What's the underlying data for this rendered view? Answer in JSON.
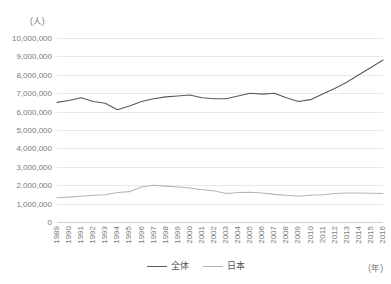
{
  "chart_data": {
    "type": "line",
    "title": "",
    "xlabel": "(年)",
    "ylabel": "(人)",
    "ylim": [
      0,
      10000000
    ],
    "ytick_step": 1000000,
    "grid": true,
    "legend_position": "bottom-center",
    "categories": [
      "1989",
      "1990",
      "1991",
      "1992",
      "1993",
      "1994",
      "1995",
      "1996",
      "1997",
      "1998",
      "1999",
      "2000",
      "2001",
      "2002",
      "2003",
      "2004",
      "2005",
      "2006",
      "2007",
      "2008",
      "2009",
      "2010",
      "2011",
      "2012",
      "2013",
      "2014",
      "2015",
      "2016"
    ],
    "yticks": [
      "0",
      "1,000,000",
      "2,000,000",
      "3,000,000",
      "4,000,000",
      "5,000,000",
      "6,000,000",
      "7,000,000",
      "8,000,000",
      "9,000,000",
      "10,000,000"
    ],
    "series": [
      {
        "name": "全体",
        "color": "#5a5a5a",
        "values": [
          6500000,
          6600000,
          6750000,
          6550000,
          6450000,
          6100000,
          6300000,
          6550000,
          6700000,
          6800000,
          6850000,
          6900000,
          6750000,
          6700000,
          6700000,
          6850000,
          7000000,
          6950000,
          7000000,
          6750000,
          6550000,
          6650000,
          6950000,
          7250000,
          7600000,
          8000000,
          8400000,
          8800000
        ]
      },
      {
        "name": "日本",
        "color": "#b4b4b4",
        "values": [
          1320000,
          1350000,
          1400000,
          1450000,
          1480000,
          1600000,
          1650000,
          1900000,
          2000000,
          1950000,
          1900000,
          1850000,
          1750000,
          1700000,
          1550000,
          1600000,
          1620000,
          1580000,
          1500000,
          1450000,
          1400000,
          1450000,
          1480000,
          1550000,
          1580000,
          1580000,
          1560000,
          1550000
        ]
      }
    ]
  },
  "legend": {
    "items": [
      {
        "label": "全体"
      },
      {
        "label": "日本"
      }
    ]
  },
  "axis": {
    "unit_y": "(人)",
    "unit_x": "(年)"
  }
}
